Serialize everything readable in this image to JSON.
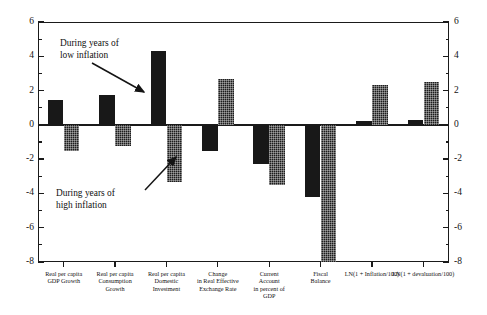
{
  "chart_data": {
    "type": "bar",
    "title": "",
    "subtitle": "",
    "xlabel": "",
    "ylabel": "",
    "ylim": [
      -8,
      6
    ],
    "grid": false,
    "legend_position": "annotation",
    "y_ticks_major": [
      6,
      4,
      2,
      0,
      -2,
      -4,
      -6,
      -8
    ],
    "y_tick_labels": [
      "6",
      "4",
      "2",
      "0",
      "-2",
      "-4",
      "-6",
      "-8"
    ],
    "y_ticks_minor": [
      5,
      3,
      1,
      -1,
      -3,
      -5,
      -7
    ],
    "dual_axis": true,
    "categories": [
      "Real per capita\nGDP Growth",
      "Real per capita\nConsumption\nGrowth",
      "Real per capita\nDomestic\nInvestment",
      "Change\nin Real Effective\nExchange Rate",
      "Current\nAccount\nin percent of\nGDP",
      "Fiscal\nBalance",
      "LN(1 + Inflation/100)",
      "LN(1 + devaluation/100)"
    ],
    "series": [
      {
        "name": "During years of low inflation",
        "style": "solid",
        "values": [
          1.45,
          1.75,
          4.3,
          -1.5,
          -2.3,
          -4.2,
          0.25,
          0.3
        ]
      },
      {
        "name": "During years of high inflation",
        "style": "hatched",
        "values": [
          -1.5,
          -1.25,
          -3.35,
          2.65,
          -3.5,
          -8.0,
          2.3,
          2.5
        ]
      }
    ],
    "annotations": [
      {
        "text": "During years of\nlow inflation",
        "target_series": "During years of low inflation"
      },
      {
        "text": "During years of\nhigh inflation",
        "target_series": "During years of high inflation"
      }
    ]
  },
  "axis": {
    "label_0": "0",
    "label_2": "2",
    "label_4": "4",
    "label_6": "6",
    "label_m2": "-2",
    "label_m4": "-4",
    "label_m6": "-6",
    "label_m8": "-8"
  }
}
